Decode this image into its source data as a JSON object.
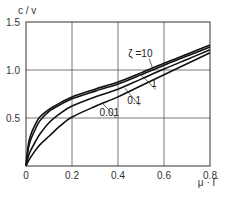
{
  "chart_data": {
    "type": "line",
    "title": "",
    "xlabel": "μ · Γ",
    "ylabel": "c / v",
    "xlim": [
      0,
      0.8
    ],
    "ylim": [
      0,
      1.5
    ],
    "xticks": [
      0,
      0.2,
      0.4,
      0.6,
      0.8
    ],
    "xtick_labels": [
      "0",
      "0.2",
      "0.4",
      "0.6",
      "0.8"
    ],
    "yticks": [
      0.5,
      1.0,
      1.5
    ],
    "ytick_labels": [
      "0.5",
      "1.0",
      "1.5"
    ],
    "grid": true,
    "legend": "inline labels with leader lines",
    "parameter_symbol": "ζ",
    "series": [
      {
        "name": "ζ = 10",
        "label": "ζ =10",
        "x": [
          0,
          0.01,
          0.02,
          0.04,
          0.06,
          0.1,
          0.15,
          0.2,
          0.3,
          0.4,
          0.5,
          0.6,
          0.7,
          0.8
        ],
        "y": [
          0,
          0.22,
          0.32,
          0.43,
          0.51,
          0.59,
          0.66,
          0.72,
          0.8,
          0.875,
          0.97,
          1.07,
          1.165,
          1.26
        ]
      },
      {
        "name": "ζ = 1",
        "label": "1",
        "x": [
          0,
          0.01,
          0.02,
          0.04,
          0.06,
          0.1,
          0.15,
          0.2,
          0.3,
          0.4,
          0.5,
          0.6,
          0.7,
          0.8
        ],
        "y": [
          0,
          0.18,
          0.27,
          0.38,
          0.47,
          0.57,
          0.64,
          0.7,
          0.78,
          0.855,
          0.95,
          1.05,
          1.145,
          1.24
        ]
      },
      {
        "name": "ζ = 0.1",
        "label": "0.1",
        "x": [
          0,
          0.01,
          0.02,
          0.04,
          0.06,
          0.1,
          0.15,
          0.2,
          0.3,
          0.4,
          0.5,
          0.6,
          0.7,
          0.8
        ],
        "y": [
          0,
          0.1,
          0.16,
          0.25,
          0.33,
          0.45,
          0.55,
          0.625,
          0.72,
          0.8,
          0.905,
          1.01,
          1.11,
          1.21
        ]
      },
      {
        "name": "ζ = 0.01",
        "label": "0.01",
        "x": [
          0,
          0.01,
          0.02,
          0.04,
          0.06,
          0.1,
          0.15,
          0.2,
          0.3,
          0.4,
          0.5,
          0.6,
          0.7,
          0.8
        ],
        "y": [
          0,
          0.05,
          0.09,
          0.16,
          0.22,
          0.31,
          0.42,
          0.51,
          0.62,
          0.72,
          0.835,
          0.95,
          1.065,
          1.18
        ]
      }
    ],
    "annotations": [
      {
        "text": "ζ =10",
        "x": 0.445,
        "y": 1.14,
        "arrow_to": [
          0.55,
          1.02
        ]
      },
      {
        "text": "1",
        "x": 0.545,
        "y": 0.82,
        "arrow_to": [
          0.5,
          0.95
        ]
      },
      {
        "text": "0.1",
        "x": 0.44,
        "y": 0.65,
        "arrow_to": [
          0.43,
          0.81
        ]
      },
      {
        "text": "0.01",
        "x": 0.32,
        "y": 0.52,
        "arrow_to": [
          0.33,
          0.66
        ]
      }
    ]
  },
  "colors": {
    "background": "#ffffff",
    "grid": "#555555",
    "curve": "#111111",
    "text": "#333333"
  }
}
